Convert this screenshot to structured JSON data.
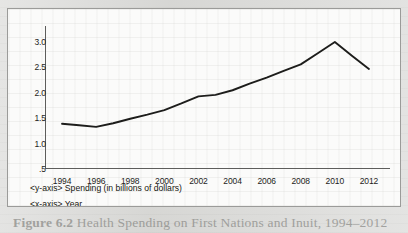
{
  "figure": {
    "caption_label": "Figure 6.2",
    "caption_text": "Health Spending on First Nations and Inuit, 1994–2012"
  },
  "axis_captions": {
    "y": "<y-axis> Spending (in billions of dollars)",
    "x": "<x-axis> Year"
  },
  "chart_data": {
    "type": "line",
    "title": "Health Spending on First Nations and Inuit, 1994–2012",
    "xlabel": "Year",
    "ylabel": "Spending (in billions of dollars)",
    "x": [
      1994,
      1995,
      1996,
      1997,
      1998,
      1999,
      2000,
      2001,
      2002,
      2003,
      2004,
      2005,
      2006,
      2007,
      2008,
      2009,
      2010,
      2011,
      2012
    ],
    "values": [
      1.39,
      1.36,
      1.33,
      1.4,
      1.49,
      1.57,
      1.66,
      1.79,
      1.93,
      1.96,
      2.05,
      2.18,
      2.3,
      2.43,
      2.56,
      2.78,
      3.0,
      2.73,
      2.47
    ],
    "series": [
      {
        "name": "Health spending",
        "values": [
          1.39,
          1.36,
          1.33,
          1.4,
          1.49,
          1.57,
          1.66,
          1.79,
          1.93,
          1.96,
          2.05,
          2.18,
          2.3,
          2.43,
          2.56,
          2.78,
          3.0,
          2.73,
          2.47
        ],
        "color": "#1d1d1b"
      }
    ],
    "xlim": [
      1993,
      2013
    ],
    "ylim": [
      0.5,
      3.0
    ],
    "ytick_labels": [
      "3.0",
      "2.5",
      "2.0",
      "1.5",
      "1.0",
      ".5"
    ],
    "ytick_values": [
      3.0,
      2.5,
      2.0,
      1.5,
      1.0,
      0.5
    ],
    "xtick_labels": [
      "1994",
      "1996",
      "1998",
      "2000",
      "2002",
      "2004",
      "2006",
      "2008",
      "2010",
      "2012"
    ],
    "xtick_values": [
      1994,
      1996,
      1998,
      2000,
      2002,
      2004,
      2006,
      2008,
      2010,
      2012
    ],
    "grid": false,
    "legend": false,
    "annotations": []
  }
}
